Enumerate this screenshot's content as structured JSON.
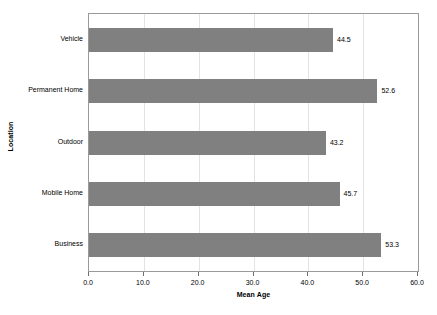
{
  "chart_data": {
    "type": "bar",
    "orientation": "horizontal",
    "title": "",
    "xlabel": "Mean Age",
    "ylabel": "Location",
    "categories": [
      "Vehicle",
      "Permanent Home",
      "Outdoor",
      "Mobile Home",
      "Business"
    ],
    "values": [
      44.5,
      52.6,
      43.2,
      45.7,
      53.3
    ],
    "value_labels": [
      "44.5",
      "52.6",
      "43.2",
      "45.7",
      "53.3"
    ],
    "xlim": [
      0.0,
      60.0
    ],
    "xticks": [
      0.0,
      10.0,
      20.0,
      30.0,
      40.0,
      50.0,
      60.0
    ],
    "xtick_labels": [
      "0.0",
      "10.0",
      "20.0",
      "30.0",
      "40.0",
      "50.0",
      "60.0"
    ],
    "grid": true,
    "grid_axis": "x",
    "legend": false,
    "bar_color": "#808080",
    "plot_border_color": "#9a9a9a",
    "gridline_color": "#e3e3e3",
    "background_color": "#ffffff"
  }
}
